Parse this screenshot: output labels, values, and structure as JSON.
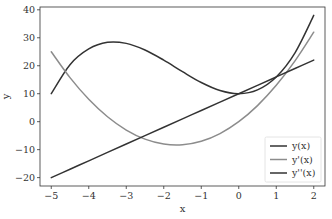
{
  "chart_data": {
    "type": "line",
    "title": "",
    "xlabel": "x",
    "ylabel": "y",
    "xlim": [
      -5.3,
      2.3
    ],
    "ylim": [
      -23,
      41
    ],
    "xticks": [
      -5,
      -4,
      -3,
      -2,
      -1,
      0,
      1,
      2
    ],
    "yticks": [
      -20,
      -10,
      0,
      10,
      20,
      30,
      40
    ],
    "grid": false,
    "legend_position": "lower right",
    "x": [
      -5.0,
      -4.5,
      -4.0,
      -3.5,
      -3.0,
      -2.5,
      -2.0,
      -1.5,
      -1.0,
      -0.5,
      0.0,
      0.5,
      1.0,
      1.5,
      2.0
    ],
    "series": [
      {
        "name": "y(x)",
        "color": "#333333",
        "formula": "x^3 + 5x^2 + 10",
        "values": [
          10.0,
          20.38,
          26.0,
          28.38,
          28.0,
          25.63,
          22.0,
          17.88,
          14.0,
          11.13,
          10.0,
          11.38,
          16.0,
          24.63,
          38.0
        ]
      },
      {
        "name": "y'(x)",
        "color": "#8c8c8c",
        "formula": "3x^2 + 10x",
        "values": [
          25.0,
          15.75,
          8.0,
          1.75,
          -3.0,
          -6.25,
          -8.0,
          -8.25,
          -7.0,
          -4.25,
          0.0,
          5.75,
          13.0,
          21.75,
          32.0
        ]
      },
      {
        "name": "y''(x)",
        "color": "#333333",
        "formula": "6x + 10",
        "values": [
          -20.0,
          -17.0,
          -14.0,
          -11.0,
          -8.0,
          -5.0,
          -2.0,
          1.0,
          4.0,
          7.0,
          10.0,
          13.0,
          16.0,
          19.0,
          22.0
        ]
      }
    ]
  },
  "axes": {
    "xlabel": "x",
    "ylabel": "y",
    "xtick_labels": [
      "−5",
      "−4",
      "−3",
      "−2",
      "−1",
      "0",
      "1",
      "2"
    ],
    "ytick_labels": [
      "−20",
      "−10",
      "0",
      "10",
      "20",
      "30",
      "40"
    ]
  },
  "legend": {
    "items": [
      {
        "label": "y(x)",
        "color": "#333333"
      },
      {
        "label": "y'(x)",
        "color": "#8c8c8c"
      },
      {
        "label": "y''(x)",
        "color": "#333333"
      }
    ]
  }
}
